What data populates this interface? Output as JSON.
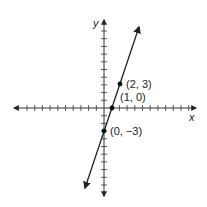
{
  "chart_data": {
    "type": "line",
    "title": "",
    "xlabel": "x",
    "ylabel": "y",
    "xlim": [
      -12,
      12
    ],
    "ylim": [
      -11,
      11
    ],
    "grid": false,
    "tick_step": 1,
    "series": [
      {
        "name": "y = 3x - 3",
        "equation": "y = 3x - 3",
        "slope": 3,
        "intercept": -3,
        "x": [
          0,
          1,
          2
        ],
        "y": [
          -3,
          0,
          3
        ],
        "arrows_both_ends": true
      }
    ],
    "points": [
      {
        "x": 2,
        "y": 3,
        "label": "(2, 3)"
      },
      {
        "x": 1,
        "y": 0,
        "label": "(1, 0)"
      },
      {
        "x": 0,
        "y": -3,
        "label": "(0, −3)"
      }
    ]
  },
  "axes": {
    "x_label": "x",
    "y_label": "y"
  },
  "labels": {
    "p1": "(2, 3)",
    "p2": "(1, 0)",
    "p3": "(0, −3)"
  },
  "colors": {
    "line": "#222222",
    "axis": "#333333",
    "background": "#ffffff"
  }
}
